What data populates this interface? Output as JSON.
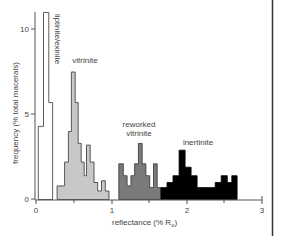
{
  "chart_data": {
    "type": "bar",
    "title": "",
    "xlabel": "reflectance (% R",
    "xlabel_sub": "o",
    "xlabel_close": ")",
    "ylabel": "frequency (% total macerals)",
    "xlim": [
      0,
      3
    ],
    "ylim": [
      0,
      11
    ],
    "xticks": [
      0,
      1,
      2,
      3
    ],
    "xminor": [
      0.5,
      1.5,
      2.5
    ],
    "yticks": [
      0,
      5,
      10
    ],
    "grid": false,
    "legend": "inline labels",
    "series": [
      {
        "name": "liptinite/exinite",
        "fill": "#ffffff",
        "stroke": "#333333",
        "bins": [
          {
            "x0": 0.03,
            "x1": 0.1,
            "value": 4.3
          },
          {
            "x0": 0.1,
            "x1": 0.17,
            "value": 11.0
          },
          {
            "x0": 0.17,
            "x1": 0.22,
            "value": 5.7
          }
        ]
      },
      {
        "name": "vitrinite",
        "fill": "#c8c8c8",
        "stroke": "#333333",
        "bins": [
          {
            "x0": 0.28,
            "x1": 0.38,
            "value": 0.8
          },
          {
            "x0": 0.38,
            "x1": 0.43,
            "value": 2.2
          },
          {
            "x0": 0.43,
            "x1": 0.47,
            "value": 4.0
          },
          {
            "x0": 0.47,
            "x1": 0.52,
            "value": 7.5
          },
          {
            "x0": 0.52,
            "x1": 0.56,
            "value": 5.7
          },
          {
            "x0": 0.56,
            "x1": 0.6,
            "value": 3.3
          },
          {
            "x0": 0.6,
            "x1": 0.64,
            "value": 2.2
          },
          {
            "x0": 0.64,
            "x1": 0.67,
            "value": 1.4
          },
          {
            "x0": 0.67,
            "x1": 0.72,
            "value": 3.2
          },
          {
            "x0": 0.72,
            "x1": 0.77,
            "value": 2.2
          },
          {
            "x0": 0.77,
            "x1": 0.82,
            "value": 1.0
          },
          {
            "x0": 0.82,
            "x1": 0.87,
            "value": 0.5
          },
          {
            "x0": 0.87,
            "x1": 0.92,
            "value": 1.1
          },
          {
            "x0": 0.92,
            "x1": 0.97,
            "value": 0.5
          }
        ]
      },
      {
        "name": "reworked vitrinite",
        "fill": "#7a7a7a",
        "stroke": "#333333",
        "bins": [
          {
            "x0": 1.1,
            "x1": 1.16,
            "value": 2.1
          },
          {
            "x0": 1.16,
            "x1": 1.21,
            "value": 1.4
          },
          {
            "x0": 1.21,
            "x1": 1.26,
            "value": 0.8
          },
          {
            "x0": 1.26,
            "x1": 1.31,
            "value": 1.4
          },
          {
            "x0": 1.31,
            "x1": 1.36,
            "value": 2.1
          },
          {
            "x0": 1.36,
            "x1": 1.41,
            "value": 3.3
          },
          {
            "x0": 1.41,
            "x1": 1.46,
            "value": 2.1
          },
          {
            "x0": 1.46,
            "x1": 1.51,
            "value": 1.4
          },
          {
            "x0": 1.51,
            "x1": 1.56,
            "value": 0.7
          },
          {
            "x0": 1.56,
            "x1": 1.61,
            "value": 2.1
          },
          {
            "x0": 1.61,
            "x1": 1.66,
            "value": 0.7
          }
        ]
      },
      {
        "name": "inertinite",
        "fill": "#000000",
        "stroke": "#000000",
        "bins": [
          {
            "x0": 1.66,
            "x1": 1.74,
            "value": 0.7
          },
          {
            "x0": 1.74,
            "x1": 1.82,
            "value": 1.0
          },
          {
            "x0": 1.82,
            "x1": 1.9,
            "value": 1.4
          },
          {
            "x0": 1.9,
            "x1": 1.98,
            "value": 2.9
          },
          {
            "x0": 1.98,
            "x1": 2.06,
            "value": 1.9
          },
          {
            "x0": 2.06,
            "x1": 2.14,
            "value": 1.4
          },
          {
            "x0": 2.14,
            "x1": 2.22,
            "value": 0.7
          },
          {
            "x0": 2.22,
            "x1": 2.3,
            "value": 0.7
          },
          {
            "x0": 2.3,
            "x1": 2.38,
            "value": 0.7
          },
          {
            "x0": 2.38,
            "x1": 2.46,
            "value": 1.0
          },
          {
            "x0": 2.46,
            "x1": 2.54,
            "value": 1.4
          },
          {
            "x0": 2.54,
            "x1": 2.6,
            "value": 1.0
          },
          {
            "x0": 2.6,
            "x1": 2.67,
            "value": 1.4
          }
        ]
      }
    ],
    "annotations": [
      {
        "text": "liptinite/exinite",
        "rotated": true
      },
      {
        "text": "vitrinite"
      },
      {
        "text": "reworked"
      },
      {
        "text": "vitrinite"
      },
      {
        "text": "inertinite"
      }
    ]
  },
  "labels": {
    "tick_0": "0",
    "tick_1": "1",
    "tick_2": "2",
    "tick_3": "3",
    "ytick_0": "0",
    "ytick_5": "5",
    "ytick_10": "10",
    "liptinite": "liptinite/exinite",
    "vitrinite": "vitrinite",
    "reworked_1": "reworked",
    "reworked_2": "vitrinite",
    "inertinite": "inertinite",
    "xlabel": "reflectance (% R",
    "xlabel_sub": "o",
    "xlabel_close": ")",
    "ylabel": "frequency (% total macerals)"
  }
}
